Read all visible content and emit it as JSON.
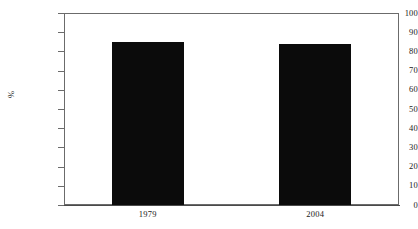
{
  "chart_data": {
    "type": "bar",
    "title": "",
    "subtitle": "",
    "xlabel": "",
    "ylabel": "%",
    "categories": [
      "1979",
      "2004"
    ],
    "values": [
      85,
      84
    ],
    "series": [
      {
        "name": "",
        "values": [
          85,
          84
        ]
      }
    ],
    "ylim": [
      0,
      100
    ],
    "ytick_labels": [
      "0",
      "10",
      "20",
      "30",
      "40",
      "50",
      "60",
      "70",
      "80",
      "90",
      "100"
    ],
    "ytick_values": [
      0,
      10,
      20,
      30,
      40,
      50,
      60,
      70,
      80,
      90,
      100
    ],
    "grid": false,
    "legend": null,
    "legend_position": "none",
    "annotations": [],
    "bar_color": "#0b0b0b",
    "axis_color": "#6b6b6b",
    "background_color": "#ffffff"
  }
}
